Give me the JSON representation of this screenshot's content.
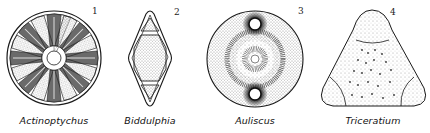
{
  "figure": {
    "type": "scientific illustration",
    "panels": [
      {
        "number": "1",
        "name": "Actinoptychus",
        "shape": "circle with radial sectors"
      },
      {
        "number": "2",
        "name": "Biddulphia",
        "shape": "rhombus with polar triangles"
      },
      {
        "number": "3",
        "name": "Auliscus",
        "shape": "circle with two ocelli"
      },
      {
        "number": "4",
        "name": "Triceratium",
        "shape": "rounded triangle with punctae"
      }
    ]
  },
  "colors": {
    "ink": "#1a1a1a",
    "background": "#ffffff"
  }
}
